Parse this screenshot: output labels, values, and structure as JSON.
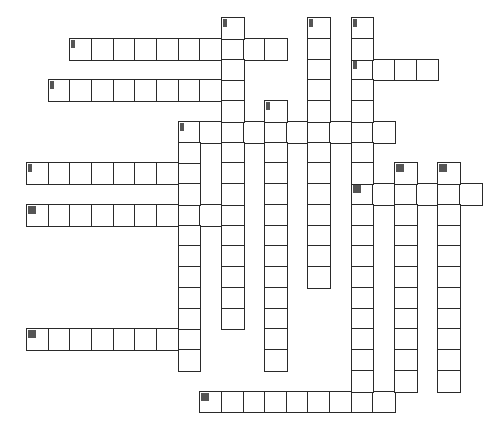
{
  "puzzle": {
    "grid": {
      "origin_x": 26,
      "origin_y": 17,
      "cell_w": 21.65,
      "cell_h": 20.75
    },
    "colors": {
      "border": "#2a2a2a",
      "cell_bg": "#ffffff",
      "marker": "#555555"
    },
    "entries": [
      {
        "id": "across-a",
        "direction": "across",
        "row": 1,
        "col": 2,
        "length": 10,
        "marker": "narrow"
      },
      {
        "id": "across-b",
        "direction": "across",
        "row": 3,
        "col": 1,
        "length": 9,
        "marker": "narrow"
      },
      {
        "id": "across-c",
        "direction": "across",
        "row": 2,
        "col": 15,
        "length": 4,
        "marker": "narrow"
      },
      {
        "id": "across-d",
        "direction": "across",
        "row": 5,
        "col": 7,
        "length": 10,
        "marker": "narrow"
      },
      {
        "id": "across-e",
        "direction": "across",
        "row": 7,
        "col": 0,
        "length": 8,
        "marker": "narrow"
      },
      {
        "id": "across-f",
        "direction": "across",
        "row": 8,
        "col": 15,
        "length": 6,
        "marker": "wide"
      },
      {
        "id": "across-g",
        "direction": "across",
        "row": 9,
        "col": 0,
        "length": 10,
        "marker": "wide"
      },
      {
        "id": "across-h",
        "direction": "across",
        "row": 15,
        "col": 0,
        "length": 8,
        "marker": "wide"
      },
      {
        "id": "across-i",
        "direction": "across",
        "row": 18,
        "col": 8,
        "length": 9,
        "marker": "wide"
      },
      {
        "id": "down-col9",
        "direction": "down",
        "row": 0,
        "col": 9,
        "length": 15,
        "marker": "narrow"
      },
      {
        "id": "down-col13",
        "direction": "down",
        "row": 0,
        "col": 13,
        "length": 13,
        "marker": "narrow"
      },
      {
        "id": "down-col15",
        "direction": "down",
        "row": 0,
        "col": 15,
        "length": 19,
        "marker": "narrow"
      },
      {
        "id": "down-col11",
        "direction": "down",
        "row": 4,
        "col": 11,
        "length": 13,
        "marker": "narrow"
      },
      {
        "id": "down-col7",
        "direction": "down",
        "row": 5,
        "col": 7,
        "length": 12,
        "marker": "narrow"
      },
      {
        "id": "down-col17",
        "direction": "down",
        "row": 7,
        "col": 17,
        "length": 11,
        "marker": "wide"
      },
      {
        "id": "down-col19",
        "direction": "down",
        "row": 7,
        "col": 19,
        "length": 11,
        "marker": "wide"
      }
    ]
  }
}
